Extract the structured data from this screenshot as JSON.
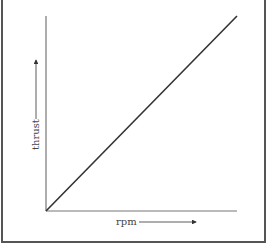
{
  "chart_data": {
    "type": "line",
    "title": "",
    "xlabel": "rpm",
    "ylabel": "thrust",
    "x": [
      0,
      1
    ],
    "series": [
      {
        "name": "thrust vs rpm",
        "values": [
          0,
          1
        ]
      }
    ],
    "relationship": "linear, proportional (through origin)",
    "xticks": [],
    "yticks": [],
    "grid": false,
    "legend": null
  },
  "colors": {
    "line": "#333333",
    "axis": "#777777",
    "frame": "#555555",
    "text": "#444444"
  }
}
